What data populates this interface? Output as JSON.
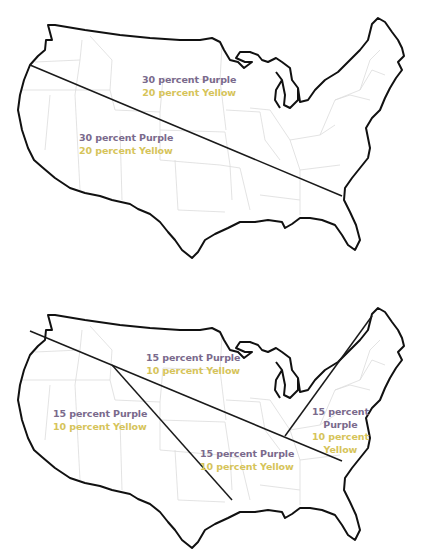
{
  "colors": {
    "purple": "#7a6a8c",
    "yellow": "#d6c45a",
    "outline": "#111111",
    "state_borders": "#dcdcdc",
    "divider_lines": "#1a1a1a"
  },
  "maps": [
    {
      "id": "top-map",
      "description": "US map divided by one diagonal line into two regions",
      "regions": [
        {
          "name": "north-east-region",
          "purple": "30 percent Purple",
          "yellow": "20 percent Yellow"
        },
        {
          "name": "south-west-region",
          "purple": "30 percent Purple",
          "yellow": "20 percent Yellow"
        }
      ]
    },
    {
      "id": "bottom-map",
      "description": "US map divided by three lines into four regions",
      "regions": [
        {
          "name": "north-region",
          "purple": "15 percent Purple",
          "yellow": "10 percent Yellow"
        },
        {
          "name": "west-region",
          "purple": "15 percent Purple",
          "yellow": "10 percent Yellow"
        },
        {
          "name": "south-central-region",
          "purple": "15 percent Purple",
          "yellow": "10 percent Yellow"
        },
        {
          "name": "east-region",
          "purple_line1": "15 percent",
          "purple_line2": "Purple",
          "yellow_line1": "10 percent",
          "yellow_line2": "Yellow"
        }
      ]
    }
  ]
}
